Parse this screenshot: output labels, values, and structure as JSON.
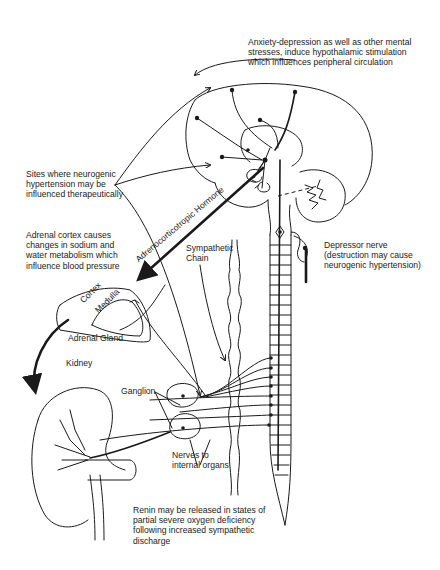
{
  "figure": {
    "labels": {
      "anxiety": "Anxiety-depression as well as other mental\nstresses, induce hypothalamic stimulation\nwhich influences peripheral circulation",
      "sites": "Sites where neurogenic\nhypertension may be\ninfluenced therapeutically",
      "adrenal_cortex_effect": "Adrenal cortex causes\nchanges in sodium and\nwater metabolism which\ninfluence blood pressure",
      "acth": "Adrenocorticotropic Hormone",
      "sympathetic_chain": "Sympathetic\nChain",
      "depressor_nerve": "Depressor nerve\n(destruction may cause\nneurogenic hypertension)",
      "cortex": "Cortex",
      "medulla": "Medulla",
      "adrenal_gland": "Adrenal Gland",
      "kidney": "Kidney",
      "ganglion": "Ganglion",
      "nerves_internal": "Nerves to\ninternal organs",
      "renin": "Renin may be released in states of\npartial severe oxygen deficiency\nfollowing increased sympathetic\ndischarge"
    },
    "structures": [
      "brain",
      "hypothalamus",
      "cerebellum",
      "brainstem",
      "spinal-cord",
      "sympathetic-chain",
      "adrenal-gland",
      "kidney",
      "ganglia"
    ],
    "colors": {
      "ink": "#1a1a1a",
      "background": "#ffffff"
    }
  }
}
